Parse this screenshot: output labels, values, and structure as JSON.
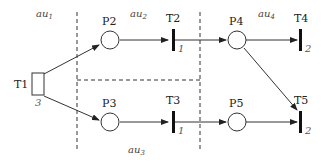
{
  "diagram": {
    "type": "petri-net",
    "regions": [
      {
        "id": "au1",
        "label": "au",
        "sub": "1"
      },
      {
        "id": "au2",
        "label": "au",
        "sub": "2"
      },
      {
        "id": "au3",
        "label": "au",
        "sub": "3"
      },
      {
        "id": "au4",
        "label": "au",
        "sub": "4"
      }
    ],
    "places": [
      {
        "id": "P2",
        "label": "P2"
      },
      {
        "id": "P3",
        "label": "P3"
      },
      {
        "id": "P4",
        "label": "P4"
      },
      {
        "id": "P5",
        "label": "P5"
      }
    ],
    "transitions": [
      {
        "id": "T1",
        "label": "T1",
        "weight": "3"
      },
      {
        "id": "T2",
        "label": "T2",
        "weight": "1"
      },
      {
        "id": "T3",
        "label": "T3",
        "weight": "1"
      },
      {
        "id": "T4",
        "label": "T4",
        "weight": "2"
      },
      {
        "id": "T5",
        "label": "T5",
        "weight": "2"
      }
    ],
    "arcs": [
      [
        "T1",
        "P2"
      ],
      [
        "T1",
        "P3"
      ],
      [
        "P2",
        "T2"
      ],
      [
        "T2",
        "P4"
      ],
      [
        "P3",
        "T3"
      ],
      [
        "T3",
        "P5"
      ],
      [
        "P4",
        "T4"
      ],
      [
        "P4",
        "T5"
      ],
      [
        "P5",
        "T5"
      ]
    ]
  }
}
